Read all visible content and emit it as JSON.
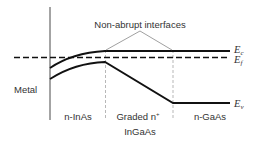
{
  "annotation": "Non-abrupt interfaces",
  "labels": {
    "metal": "Metal",
    "region1": "n-InAs",
    "region2": "Graded n",
    "region2_sup": "+",
    "region2_sub": "InGaAs",
    "region3": "n-GaAs"
  },
  "bands": {
    "ec": {
      "main": "E",
      "sub": "c"
    },
    "ef": {
      "main": "E",
      "sub": "f"
    },
    "ev": {
      "main": "E",
      "sub": "v"
    }
  },
  "colors": {
    "line": "#111111",
    "guide": "#999999",
    "text": "#333333"
  }
}
